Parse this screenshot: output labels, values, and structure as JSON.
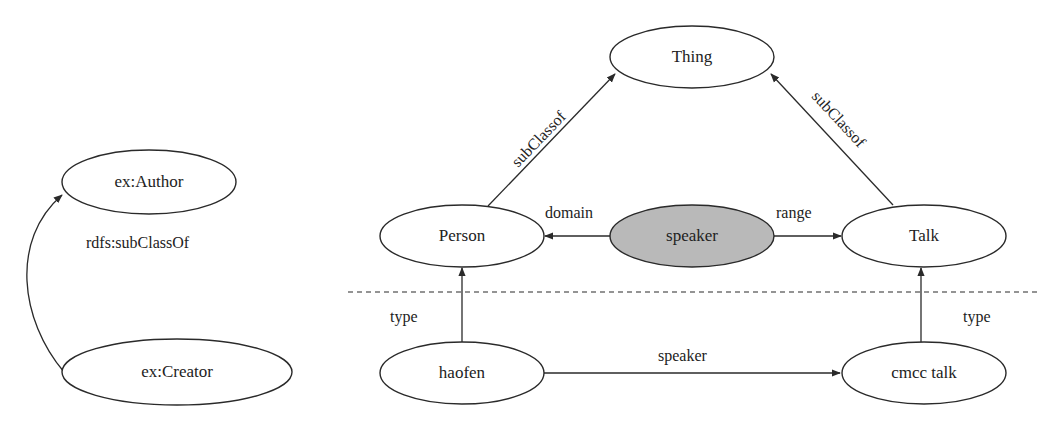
{
  "diagram": {
    "left": {
      "nodes": {
        "author": {
          "label": "ex:Author"
        },
        "creator": {
          "label": "ex:Creator"
        }
      },
      "edges": {
        "subclass": {
          "label": "rdfs:subClassOf",
          "from": "ex:Creator",
          "to": "ex:Author"
        }
      }
    },
    "right": {
      "schema_nodes": {
        "thing": {
          "label": "Thing"
        },
        "person": {
          "label": "Person"
        },
        "speaker": {
          "label": "speaker",
          "fill": "#b9b9b9"
        },
        "talk": {
          "label": "Talk"
        }
      },
      "instance_nodes": {
        "haofen": {
          "label": "haofen"
        },
        "cmcc_talk": {
          "label": "cmcc talk"
        }
      },
      "edges": {
        "person_subclass": {
          "label": "subClassof",
          "from": "Person",
          "to": "Thing"
        },
        "talk_subclass": {
          "label": "subClassof",
          "from": "Talk",
          "to": "Thing"
        },
        "domain": {
          "label": "domain",
          "from": "speaker",
          "to": "Person"
        },
        "range": {
          "label": "range",
          "from": "speaker",
          "to": "Talk"
        },
        "haofen_type": {
          "label": "type",
          "from": "haofen",
          "to": "Person"
        },
        "cmcc_type": {
          "label": "type",
          "from": "cmcc talk",
          "to": "Talk"
        },
        "speaker_instance": {
          "label": "speaker",
          "from": "haofen",
          "to": "cmcc talk"
        }
      }
    },
    "colors": {
      "stroke": "#2a2a2a",
      "highlight_fill": "#b9b9b9",
      "background": "#ffffff"
    }
  }
}
